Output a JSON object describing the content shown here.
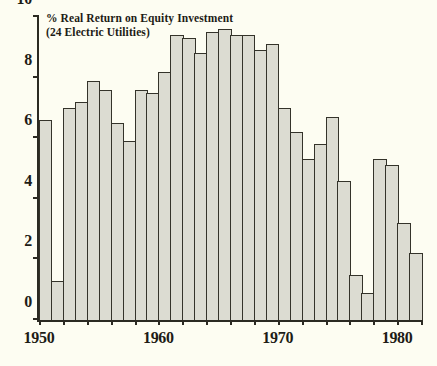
{
  "chart_data": {
    "type": "bar",
    "title": "% Real Return on Equity Investment",
    "subtitle": "(24 Electric Utilities)",
    "xlabel": "",
    "ylabel": "",
    "grid": false,
    "legend": "none",
    "xlim": [
      1950,
      1982
    ],
    "ylim": [
      0,
      10
    ],
    "y_ticks": [
      0,
      2,
      4,
      6,
      8,
      10
    ],
    "y_tick_labels": [
      "0",
      "2",
      "4",
      "6",
      "8",
      "10"
    ],
    "x_ticks": [
      1950,
      1960,
      1970,
      1980
    ],
    "x_tick_labels": [
      "1950",
      "1960",
      "1970",
      "1980"
    ],
    "categories": [
      "1950",
      "1951",
      "1952",
      "1953",
      "1954",
      "1955",
      "1956",
      "1957",
      "1958",
      "1959",
      "1960",
      "1961",
      "1962",
      "1963",
      "1964",
      "1965",
      "1966",
      "1967",
      "1968",
      "1969",
      "1970",
      "1971",
      "1972",
      "1973",
      "1974",
      "1975",
      "1976",
      "1977",
      "1978",
      "1979",
      "1980",
      "1981"
    ],
    "values": [
      6.6,
      1.3,
      7.0,
      7.2,
      7.9,
      7.6,
      6.5,
      5.9,
      7.6,
      7.5,
      8.2,
      9.4,
      9.3,
      8.8,
      9.5,
      9.6,
      9.4,
      9.4,
      8.9,
      9.1,
      7.0,
      6.2,
      5.3,
      5.8,
      6.7,
      4.6,
      1.5,
      0.9,
      5.3,
      5.1,
      3.2,
      2.2
    ],
    "series_name": "Real Return on Equity"
  }
}
